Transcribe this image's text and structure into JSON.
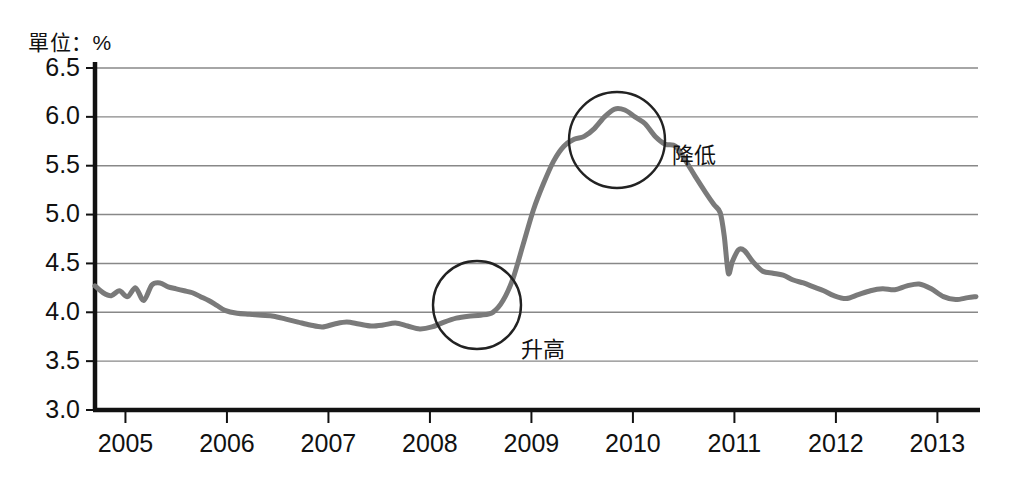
{
  "unit_label": "單位：%",
  "colors": {
    "line": "#7a7a7a",
    "axis": "#111111",
    "grid": "#888888",
    "annotation": "#222222",
    "text": "#111111"
  },
  "axis": {
    "y_ticks": [
      "3.0",
      "3.5",
      "4.0",
      "4.5",
      "5.0",
      "5.5",
      "6.0",
      "6.5"
    ],
    "x_ticks": [
      "2005",
      "2006",
      "2007",
      "2008",
      "2009",
      "2010",
      "2011",
      "2012",
      "2013"
    ]
  },
  "annotations": [
    {
      "name": "rise",
      "label": "升高",
      "cx": 477,
      "cy": 305,
      "r": 44,
      "label_x": 521,
      "label_y": 357
    },
    {
      "name": "fall",
      "label": "降低",
      "cx": 617,
      "cy": 140,
      "r": 48,
      "label_x": 672,
      "label_y": 163
    }
  ],
  "chart_data": {
    "type": "line",
    "title": "",
    "subtitle": "",
    "xlabel": "",
    "ylabel": "單位：%",
    "ylim": [
      3.0,
      6.5
    ],
    "xlim": [
      2004.7,
      2013.4
    ],
    "grid": true,
    "legend": null,
    "yticks": [
      3.0,
      3.5,
      4.0,
      4.5,
      5.0,
      5.5,
      6.0,
      6.5
    ],
    "xticks": [
      2005,
      2006,
      2007,
      2008,
      2009,
      2010,
      2011,
      2012,
      2013
    ],
    "annotations": [
      {
        "text": "升高",
        "at_x": 2008.4,
        "at_y": 4.0,
        "meaning": "rise"
      },
      {
        "text": "降低",
        "at_x": 2009.8,
        "at_y": 5.75,
        "meaning": "fall"
      }
    ],
    "series": [
      {
        "name": "unemployment-rate",
        "color": "#7a7a7a",
        "x": [
          2004.7,
          2004.78,
          2004.86,
          2004.94,
          2005.02,
          2005.1,
          2005.18,
          2005.26,
          2005.34,
          2005.42,
          2005.5,
          2005.58,
          2005.66,
          2005.74,
          2005.82,
          2005.9,
          2005.98,
          2006.1,
          2006.22,
          2006.34,
          2006.46,
          2006.58,
          2006.7,
          2006.82,
          2006.94,
          2007.06,
          2007.18,
          2007.3,
          2007.42,
          2007.54,
          2007.66,
          2007.78,
          2007.9,
          2008.02,
          2008.14,
          2008.26,
          2008.38,
          2008.5,
          2008.62,
          2008.72,
          2008.82,
          2008.92,
          2009.02,
          2009.12,
          2009.22,
          2009.32,
          2009.42,
          2009.52,
          2009.62,
          2009.72,
          2009.82,
          2009.92,
          2010.02,
          2010.12,
          2010.22,
          2010.32,
          2010.42,
          2010.52,
          2010.62,
          2010.72,
          2010.8,
          2010.86,
          2010.9,
          2010.94,
          2010.98,
          2011.04,
          2011.1,
          2011.18,
          2011.28,
          2011.38,
          2011.48,
          2011.58,
          2011.68,
          2011.78,
          2011.88,
          2011.98,
          2012.1,
          2012.22,
          2012.34,
          2012.46,
          2012.58,
          2012.7,
          2012.82,
          2012.94,
          2013.06,
          2013.18,
          2013.3,
          2013.38
        ],
        "y": [
          4.27,
          4.2,
          4.17,
          4.22,
          4.16,
          4.25,
          4.12,
          4.28,
          4.3,
          4.26,
          4.24,
          4.22,
          4.2,
          4.16,
          4.12,
          4.07,
          4.02,
          3.99,
          3.98,
          3.97,
          3.96,
          3.93,
          3.9,
          3.87,
          3.85,
          3.88,
          3.9,
          3.88,
          3.86,
          3.87,
          3.89,
          3.86,
          3.83,
          3.85,
          3.9,
          3.94,
          3.96,
          3.97,
          4.0,
          4.12,
          4.35,
          4.7,
          5.05,
          5.32,
          5.55,
          5.7,
          5.77,
          5.8,
          5.88,
          6.0,
          6.08,
          6.07,
          6.0,
          5.93,
          5.8,
          5.72,
          5.7,
          5.55,
          5.38,
          5.22,
          5.1,
          5.02,
          4.78,
          4.4,
          4.52,
          4.64,
          4.63,
          4.52,
          4.42,
          4.4,
          4.38,
          4.33,
          4.3,
          4.26,
          4.22,
          4.17,
          4.14,
          4.18,
          4.22,
          4.24,
          4.23,
          4.27,
          4.29,
          4.24,
          4.16,
          4.13,
          4.15,
          4.16
        ]
      }
    ]
  }
}
